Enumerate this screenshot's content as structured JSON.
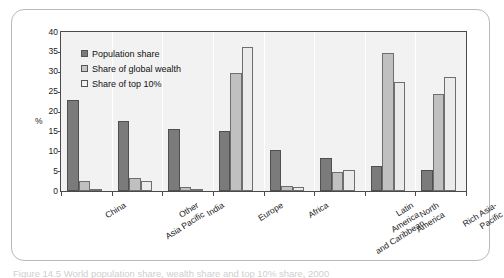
{
  "figure": {
    "caption": "Figure 14.5 World population share, wealth share and top 10% share, 2000",
    "axis_unit_label": "%"
  },
  "legend": {
    "items": [
      {
        "label": "Population share",
        "color": "#7b7b7b",
        "icon": "legend-swatch-filled"
      },
      {
        "label": "Share of global wealth",
        "color": "#c6c6c6",
        "icon": "legend-swatch-light"
      },
      {
        "label": "Share of top 10%",
        "color": "#f3f3f3",
        "icon": "legend-swatch-empty"
      }
    ]
  },
  "chart_data": {
    "type": "bar",
    "title": "",
    "subtitle": "",
    "xlabel": "",
    "ylabel": "%",
    "ylim": [
      0,
      40
    ],
    "ytick_values": [
      0,
      5,
      10,
      15,
      20,
      25,
      30,
      35,
      40
    ],
    "ytick_labels": [
      "0",
      "5",
      "10",
      "15",
      "20",
      "25",
      "30",
      "35",
      "40"
    ],
    "grid": false,
    "legend_position": "upper-left-inside",
    "categories": [
      "China",
      "Other Asia Pacific",
      "India",
      "Europe",
      "Africa",
      "Latin America and Caribbean",
      "North America",
      "Rich Asia-Pacific"
    ],
    "category_label_lines": [
      [
        "China"
      ],
      [
        "Other",
        "Asia Pacific"
      ],
      [
        "India"
      ],
      [
        "Europe"
      ],
      [
        "Africa"
      ],
      [
        "Latin",
        "America",
        "and Caribbean"
      ],
      [
        "North",
        "America"
      ],
      [
        "Rich Asia-",
        "Pacific"
      ]
    ],
    "series": [
      {
        "name": "Population share",
        "color": "#7b7b7b",
        "values": [
          22.8,
          17.7,
          15.6,
          15.1,
          10.4,
          8.4,
          6.4,
          5.4
        ]
      },
      {
        "name": "Share of global wealth",
        "color": "#c0c0c0",
        "values": [
          2.6,
          3.3,
          1.0,
          29.6,
          1.2,
          4.7,
          34.6,
          24.5
        ]
      },
      {
        "name": "Share of top 10%",
        "color": "#ebebeb",
        "values": [
          0.3,
          2.6,
          0.4,
          36.2,
          0.9,
          5.3,
          27.5,
          28.6
        ]
      }
    ]
  }
}
